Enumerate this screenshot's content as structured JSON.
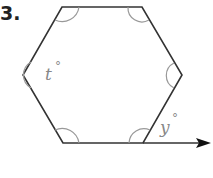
{
  "problem": {
    "number": "3.",
    "figure": "regular hexagon with interior angles marked and one exterior angle",
    "labels": {
      "interior_angle": "t",
      "exterior_angle": "y",
      "degree_symbol": "°"
    }
  }
}
